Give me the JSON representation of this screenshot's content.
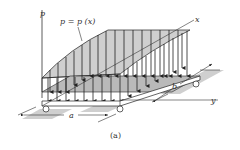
{
  "figure": {
    "caption": "(a)",
    "labels": {
      "p_axis": "p",
      "x_axis": "x",
      "y_axis": "y",
      "load_function": "p = p (x)",
      "dim_a": "a",
      "dim_b": "b"
    },
    "colors": {
      "load_fill": "#c8c8c8",
      "plate_top": "#bfbfbf",
      "support_shadow": "#c9c9c9",
      "lines": "#222222"
    }
  }
}
